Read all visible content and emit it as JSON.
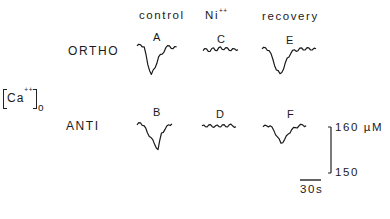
{
  "chart_data": {
    "type": "line",
    "title": "",
    "ylabel": "[Ca++]o",
    "columns": [
      "control",
      "Ni++",
      "recovery"
    ],
    "rows": [
      "ORTHO",
      "ANTI"
    ],
    "scale_bar": {
      "y_top_label": "160 µM",
      "y_bottom_label": "150",
      "x_label": "30s"
    },
    "ylim": [
      150,
      160
    ],
    "panels": [
      {
        "id": "A",
        "row": "ORTHO",
        "condition": "control",
        "t_s": [
          0,
          5,
          10,
          15,
          20,
          25,
          30,
          35,
          40,
          45,
          50,
          55
        ],
        "ca_uM": [
          159.6,
          159.8,
          159.4,
          155.5,
          153.4,
          154.8,
          157.2,
          157.8,
          159.2,
          159.6,
          159.0,
          159.4
        ]
      },
      {
        "id": "C",
        "row": "ORTHO",
        "condition": "Ni++",
        "t_s": [
          0,
          5,
          10,
          15,
          20,
          25,
          30,
          35,
          40,
          45,
          50
        ],
        "ca_uM": [
          159.0,
          159.4,
          158.8,
          159.6,
          159.0,
          159.8,
          159.2,
          159.6,
          159.0,
          159.4,
          159.2
        ]
      },
      {
        "id": "E",
        "row": "ORTHO",
        "condition": "recovery",
        "t_s": [
          0,
          5,
          10,
          15,
          20,
          25,
          30,
          35,
          40,
          45,
          50,
          55,
          60,
          65,
          70,
          75
        ],
        "ca_uM": [
          159.6,
          159.8,
          159.2,
          157.4,
          155.0,
          154.2,
          155.2,
          157.6,
          158.6,
          159.4,
          159.2,
          159.8,
          159.4,
          159.8,
          159.4,
          159.6
        ]
      },
      {
        "id": "B",
        "row": "ANTI",
        "condition": "control",
        "t_s": [
          0,
          5,
          10,
          15,
          20,
          25,
          30,
          35,
          40,
          45,
          50
        ],
        "ca_uM": [
          159.4,
          159.8,
          159.2,
          157.6,
          156.6,
          155.2,
          154.0,
          157.6,
          158.4,
          159.4,
          159.6
        ]
      },
      {
        "id": "D",
        "row": "ANTI",
        "condition": "Ni++",
        "t_s": [
          0,
          5,
          10,
          15,
          20,
          25,
          30,
          35,
          40,
          45,
          50
        ],
        "ca_uM": [
          159.4,
          159.2,
          159.6,
          159.2,
          159.4,
          159.2,
          159.6,
          159.2,
          159.6,
          159.4,
          159.2
        ]
      },
      {
        "id": "F",
        "row": "ANTI",
        "condition": "recovery",
        "t_s": [
          0,
          5,
          10,
          15,
          20,
          25,
          30,
          35,
          40,
          45,
          50,
          55,
          60
        ],
        "ca_uM": [
          159.4,
          159.6,
          159.6,
          158.6,
          157.2,
          155.8,
          156.6,
          157.8,
          158.8,
          159.2,
          159.6,
          159.8,
          159.6
        ]
      }
    ],
    "grid": false,
    "legend": null
  },
  "labels": {
    "col_control": "control",
    "col_ni_base": "Ni",
    "col_ni_sup": "++",
    "col_recovery": "recovery",
    "row_ortho": "ORTHO",
    "row_anti": "ANTI",
    "ca_base": "Ca",
    "ca_sup": "++",
    "ca_sub": "o",
    "panel_a": "A",
    "panel_b": "B",
    "panel_c": "C",
    "panel_d": "D",
    "panel_e": "E",
    "panel_f": "F",
    "scale_top": "160 µM",
    "scale_bottom": "150",
    "time_bar": "30s"
  }
}
